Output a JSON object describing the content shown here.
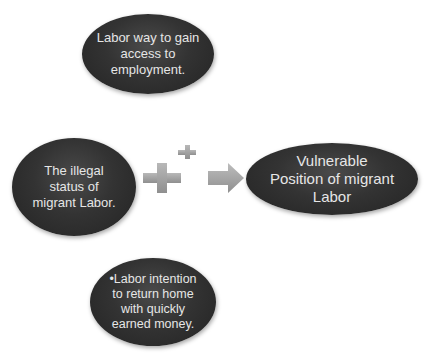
{
  "diagram": {
    "nodes": [
      {
        "id": "top",
        "lines": [
          "Labor way to gain",
          "access to",
          "employment."
        ]
      },
      {
        "id": "left",
        "lines": [
          "The illegal",
          "status of",
          "migrant Labor."
        ]
      },
      {
        "id": "right",
        "lines": [
          "Vulnerable",
          "Position of migrant",
          "Labor"
        ]
      },
      {
        "id": "bottom",
        "lines": [
          "•Labor intention",
          "to return home",
          "with quickly",
          "earned money."
        ]
      }
    ],
    "connectors": [
      {
        "type": "plus",
        "size": "large"
      },
      {
        "type": "plus",
        "size": "small"
      },
      {
        "type": "arrow",
        "direction": "right",
        "target": "right"
      }
    ],
    "colors": {
      "node_fill": "#2e2e2e",
      "node_text": "#e6e6e6",
      "connector_fill": "#a6a6a6",
      "background": "#ffffff"
    }
  }
}
